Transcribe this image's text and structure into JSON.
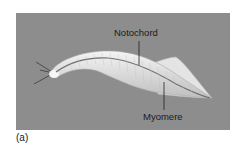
{
  "figure": {
    "panel_background": "#8d8d8d",
    "labels": {
      "notochord": "Notochord",
      "myomere": "Myomere"
    },
    "caption": "(a)"
  }
}
